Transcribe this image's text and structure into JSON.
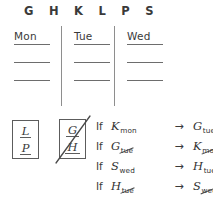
{
  "sheet": {
    "title": "Logic puzzle scratchwork"
  },
  "entity_roster": {
    "name": "entity-roster",
    "letters": [
      "G",
      "H",
      "K",
      "L",
      "P",
      "S"
    ]
  },
  "day_grid": {
    "columns": [
      {
        "heading": "Mon",
        "slots": [
          "",
          "",
          ""
        ]
      },
      {
        "heading": "Tue",
        "slots": [
          "",
          "",
          ""
        ]
      },
      {
        "heading": "Wed",
        "slots": [
          "",
          "",
          ""
        ]
      }
    ]
  },
  "deductions": {
    "boxes": [
      {
        "name": "box-lp",
        "top_letter": "L",
        "bottom_letter": "P",
        "crossed_out": false
      },
      {
        "name": "box-gh",
        "top_letter": "G",
        "bottom_letter": "H",
        "crossed_out": true
      }
    ]
  },
  "rules": [
    {
      "if_label": "If",
      "antecedent": {
        "letter": "K",
        "day": "mon",
        "struck": false
      },
      "arrow": "→",
      "consequent": {
        "letter": "G",
        "day": "tue",
        "struck": false
      }
    },
    {
      "if_label": "If",
      "antecedent": {
        "letter": "G",
        "day": "tue",
        "struck": true
      },
      "arrow": "→",
      "consequent": {
        "letter": "K",
        "day": "mon",
        "struck": true
      }
    },
    {
      "if_label": "If",
      "antecedent": {
        "letter": "S",
        "day": "wed",
        "struck": false
      },
      "arrow": "→",
      "consequent": {
        "letter": "H",
        "day": "tue",
        "struck": false
      }
    },
    {
      "if_label": "If",
      "antecedent": {
        "letter": "H",
        "day": "tue",
        "struck": true
      },
      "arrow": "→",
      "consequent": {
        "letter": "S",
        "day": "wed",
        "struck": true
      }
    }
  ],
  "colors": {
    "ink": "#3a3a3a",
    "rule_line": "#6d6d6d",
    "divider": "#8e8e8e",
    "background": "#ffffff"
  }
}
